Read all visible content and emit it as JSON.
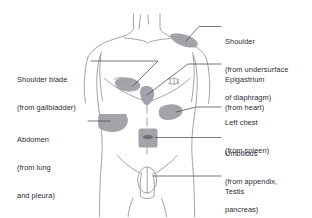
{
  "figure": {
    "background_color": "#ffffff",
    "outline_color": "#8c8c94",
    "patch_fill": "#9b9ba3",
    "patch_fill_dark": "#84848d",
    "text_color": "#2b2b33",
    "leader_color": "#4a4a52"
  },
  "labels": {
    "shoulder": {
      "title": "Shoulder",
      "line2": "(from undersurface",
      "line3": "of diaphragm)",
      "side": "right"
    },
    "epigastrium": {
      "title": "Epigastrium",
      "line2": "(from heart)",
      "side": "right"
    },
    "left_chest": {
      "title": "Left chest",
      "line2": "(from spleen)",
      "side": "right"
    },
    "umbilicus": {
      "title": "Umbilicus",
      "line2": "(from appendix,",
      "line3": "pancreas)",
      "side": "right"
    },
    "testis": {
      "title": "Testis",
      "line2": "(from ureter)",
      "side": "right"
    },
    "shoulder_blade": {
      "title": "Shoulder blade",
      "line2": "(from gallbladder)",
      "side": "left"
    },
    "abdomen": {
      "title": "Abdomen",
      "line2": "(from lung",
      "line3": "and pleura)",
      "side": "left"
    }
  }
}
